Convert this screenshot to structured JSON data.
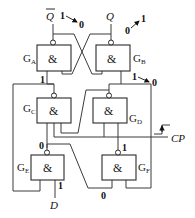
{
  "diagram": {
    "type": "logic-circuit",
    "outputs": {
      "q_bar": "Q",
      "q": "Q"
    },
    "inputs": {
      "clock": "CP",
      "data": "D"
    },
    "gate_symbol": "&",
    "gates": [
      {
        "id": "GA",
        "label": "G",
        "sub": "A"
      },
      {
        "id": "GB",
        "label": "G",
        "sub": "B"
      },
      {
        "id": "GC",
        "label": "G",
        "sub": "C"
      },
      {
        "id": "GD",
        "label": "G",
        "sub": "D"
      },
      {
        "id": "GE",
        "label": "G",
        "sub": "E"
      },
      {
        "id": "GF",
        "label": "G",
        "sub": "F"
      }
    ],
    "annotations": {
      "qbar_transition_from": "1",
      "qbar_transition_to": "0",
      "q_transition_from": "0",
      "q_transition_to": "1",
      "ga_input": "1",
      "gb_input_from": "1",
      "gb_input_to": "0",
      "ge_output": "0",
      "gf_output": "1",
      "d_value": "1",
      "gf_input": "0"
    }
  }
}
